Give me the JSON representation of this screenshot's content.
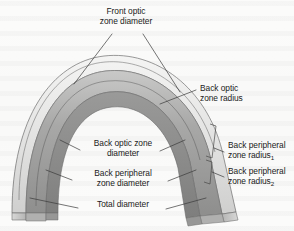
{
  "figure": {
    "kind": "labeled-cross-section-diagram",
    "background_color": "#fbfbfa",
    "ink_color": "#1b1b1b"
  },
  "labels": {
    "front_optic_zone_diameter": {
      "line1": "Front optic",
      "line2": "zone diameter"
    },
    "back_optic_zone_radius": {
      "line1": "Back optic",
      "line2": "zone radius"
    },
    "back_peripheral_zone_radius_1": {
      "line1": "Back peripheral",
      "line2_text": "zone radius",
      "line2_sub": "1"
    },
    "back_peripheral_zone_radius_2": {
      "line1": "Back peripheral",
      "line2_text": "zone radius",
      "line2_sub": "2"
    },
    "back_optic_zone_diameter": {
      "line1": "Back optic zone",
      "line2": "diameter"
    },
    "back_peripheral_zone_diameter": {
      "line1": "Back peripheral",
      "line2": "zone diameter"
    },
    "total_diameter": {
      "line1": "Total diameter"
    }
  },
  "lens_shading": {
    "front_surface_highlight": "#f2f2f1",
    "outer_band_light": "#e3e3e2",
    "mid_band": "#b9b9b8",
    "body_gray": "#a2a2a1",
    "inner_dark": "#8a8a89",
    "edge_stroke": "#6f6f6e",
    "thin_line": "#575756"
  },
  "leader_lines": {
    "stroke": "#3a3a3a",
    "width": 0.7
  }
}
